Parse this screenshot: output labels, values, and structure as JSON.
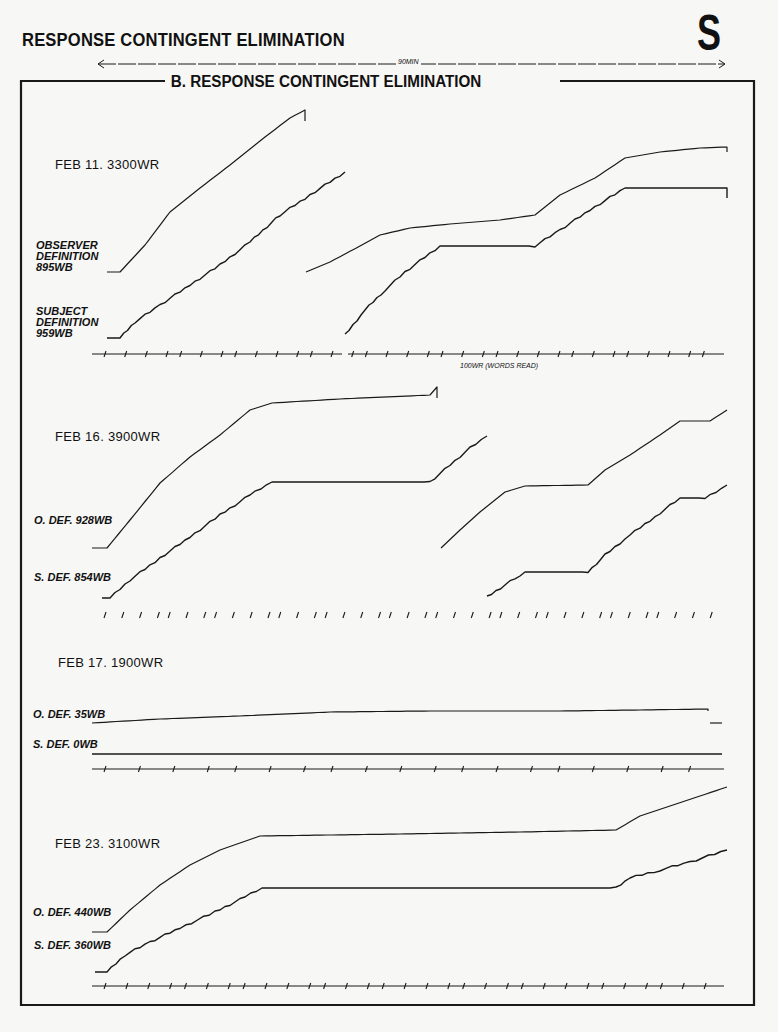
{
  "header": {
    "title": "RESPONSE CONTINGENT ELIMINATION",
    "corner_letter": "S",
    "duration_label": "90MIN",
    "frame_title": "B. RESPONSE CONTINGENT ELIMINATION"
  },
  "axis_note": "100WR (WORDS READ)",
  "panels": [
    {
      "date_label": "FEB 11. 3300WR",
      "observer_label": [
        "OBSERVER",
        "DEFINITION",
        "895WB"
      ],
      "subject_label": [
        "SUBJECT",
        "DEFINITION",
        "959WB"
      ]
    },
    {
      "date_label": "FEB 16. 3900WR",
      "observer_label": [
        "O. DEF. 928WB"
      ],
      "subject_label": [
        "S. DEF. 854WB"
      ]
    },
    {
      "date_label": "FEB 17. 1900WR",
      "observer_label": [
        "O. DEF. 35WB"
      ],
      "subject_label": [
        "S. DEF. 0WB"
      ]
    },
    {
      "date_label": "FEB 23. 3100WR",
      "observer_label": [
        "O. DEF. 440WB"
      ],
      "subject_label": [
        "S. DEF. 360WB"
      ]
    }
  ],
  "chart_data": {
    "type": "line",
    "title": "B. RESPONSE CONTINGENT ELIMINATION",
    "subtitle": "RESPONSE CONTINGENT ELIMINATION",
    "xlabel": "Time (session length 90 MIN); hash marks = 100WR (WORDS READ)",
    "ylabel": "Cumulative word-blocks (WB)",
    "legend": [
      "Observer definition (O. DEF.)",
      "Subject definition (S. DEF.)"
    ],
    "grid": false,
    "sessions": [
      {
        "date": "FEB 11",
        "words_read": 3300,
        "series": [
          {
            "name": "Observer definition",
            "total_wb": 895,
            "segments": [
              [
                [
                  107,
                  272
                ],
                [
                  120,
                  272
                ],
                [
                  145,
                  245
                ],
                [
                  170,
                  212
                ],
                [
                  200,
                  188
                ],
                [
                  230,
                  165
                ],
                [
                  265,
                  137
                ],
                [
                  290,
                  118
                ],
                [
                  305,
                  110
                ],
                [
                  305,
                  121
                ]
              ],
              [
                [
                  306,
                  272
                ],
                [
                  330,
                  262
                ],
                [
                  360,
                  246
                ],
                [
                  380,
                  235
                ],
                [
                  410,
                  228
                ],
                [
                  450,
                  224
                ],
                [
                  500,
                  220
                ],
                [
                  535,
                  215
                ],
                [
                  560,
                  195
                ],
                [
                  595,
                  178
                ],
                [
                  625,
                  158
                ],
                [
                  660,
                  152
                ],
                [
                  700,
                  148
                ],
                [
                  727,
                  147
                ],
                [
                  727,
                  152
                ]
              ]
            ]
          },
          {
            "name": "Subject definition",
            "total_wb": 959,
            "segments": [
              [
                [
                  107,
                  338
                ],
                [
                  120,
                  338
                ],
                [
                  135,
                  322
                ],
                [
                  160,
                  305
                ],
                [
                  190,
                  285
                ],
                [
                  220,
                  265
                ],
                [
                  250,
                  242
                ],
                [
                  280,
                  215
                ],
                [
                  310,
                  195
                ],
                [
                  345,
                  172
                ]
              ],
              [
                [
                  345,
                  335
                ],
                [
                  365,
                  310
                ],
                [
                  385,
                  290
                ],
                [
                  405,
                  272
                ],
                [
                  425,
                  257
                ],
                [
                  440,
                  246
                ],
                [
                  455,
                  246
                ],
                [
                  535,
                  246
                ],
                [
                  560,
                  230
                ],
                [
                  590,
                  210
                ],
                [
                  625,
                  188
                ],
                [
                  727,
                  188
                ],
                [
                  727,
                  198
                ]
              ]
            ]
          }
        ],
        "tick_axis_y": 354
      },
      {
        "date": "FEB 16",
        "words_read": 3900,
        "series": [
          {
            "name": "Observer definition",
            "total_wb": 928,
            "segments": [
              [
                [
                  92,
                  548
                ],
                [
                  107,
                  548
                ],
                [
                  130,
                  520
                ],
                [
                  160,
                  483
                ],
                [
                  190,
                  457
                ],
                [
                  220,
                  435
                ],
                [
                  250,
                  410
                ],
                [
                  272,
                  403
                ],
                [
                  340,
                  399
                ],
                [
                  430,
                  395
                ],
                [
                  437,
                  387
                ],
                [
                  437,
                  398
                ]
              ],
              [
                [
                  441,
                  548
                ],
                [
                  460,
                  530
                ],
                [
                  480,
                  512
                ],
                [
                  505,
                  492
                ],
                [
                  525,
                  486
                ],
                [
                  588,
                  485
                ],
                [
                  605,
                  470
                ],
                [
                  630,
                  455
                ],
                [
                  660,
                  435
                ],
                [
                  680,
                  421
                ],
                [
                  710,
                  421
                ],
                [
                  727,
                  410
                ]
              ]
            ]
          },
          {
            "name": "Subject definition",
            "total_wb": 854,
            "segments": [
              [
                [
                  102,
                  598
                ],
                [
                  110,
                  598
                ],
                [
                  130,
                  580
                ],
                [
                  160,
                  558
                ],
                [
                  190,
                  537
                ],
                [
                  220,
                  515
                ],
                [
                  250,
                  495
                ],
                [
                  272,
                  482
                ],
                [
                  430,
                  482
                ],
                [
                  450,
                  465
                ],
                [
                  470,
                  448
                ],
                [
                  487,
                  436
                ]
              ],
              [
                [
                  487,
                  597
                ],
                [
                  505,
                  585
                ],
                [
                  520,
                  575
                ],
                [
                  525,
                  572
                ],
                [
                  588,
                  572
                ],
                [
                  605,
                  555
                ],
                [
                  630,
                  535
                ],
                [
                  660,
                  513
                ],
                [
                  680,
                  498
                ],
                [
                  705,
                  498
                ],
                [
                  727,
                  485
                ]
              ]
            ]
          }
        ],
        "tick_axis_y": 615
      },
      {
        "date": "FEB 17",
        "words_read": 1900,
        "series": [
          {
            "name": "Observer definition",
            "total_wb": 35,
            "segments": [
              [
                [
                  92,
                  723
                ],
                [
                  160,
                  719
                ],
                [
                  240,
                  716
                ],
                [
                  330,
                  712
                ],
                [
                  430,
                  711
                ],
                [
                  560,
                  711
                ],
                [
                  640,
                  710
                ],
                [
                  708,
                  709
                ],
                [
                  708,
                  711
                ]
              ],
              [
                [
                  710,
                  723
                ],
                [
                  722,
                  723
                ]
              ]
            ]
          },
          {
            "name": "Subject definition",
            "total_wb": 0,
            "segments": [
              [
                [
                  92,
                  754
                ],
                [
                  722,
                  754
                ]
              ]
            ]
          }
        ],
        "tick_axis_y": 769
      },
      {
        "date": "FEB 23",
        "words_read": 3100,
        "series": [
          {
            "name": "Observer definition",
            "total_wb": 440,
            "segments": [
              [
                [
                  92,
                  932
                ],
                [
                  107,
                  932
                ],
                [
                  130,
                  910
                ],
                [
                  160,
                  885
                ],
                [
                  190,
                  865
                ],
                [
                  220,
                  850
                ],
                [
                  260,
                  836
                ],
                [
                  400,
                  834
                ],
                [
                  520,
                  832
                ],
                [
                  616,
                  830
                ],
                [
                  640,
                  816
                ],
                [
                  670,
                  806
                ],
                [
                  700,
                  796
                ],
                [
                  727,
                  787
                ]
              ]
            ]
          },
          {
            "name": "Subject definition",
            "total_wb": 360,
            "segments": [
              [
                [
                  95,
                  972
                ],
                [
                  107,
                  972
                ],
                [
                  125,
                  955
                ],
                [
                  150,
                  942
                ],
                [
                  180,
                  928
                ],
                [
                  215,
                  912
                ],
                [
                  245,
                  897
                ],
                [
                  262,
                  888
                ],
                [
                  400,
                  888
                ],
                [
                  520,
                  888
                ],
                [
                  616,
                  888
                ],
                [
                  630,
                  878
                ],
                [
                  660,
                  870
                ],
                [
                  690,
                  862
                ],
                [
                  727,
                  850
                ]
              ]
            ]
          }
        ],
        "tick_axis_y": 986
      }
    ],
    "duration_minutes": 90
  },
  "colors": {
    "ink": "#1a1a1a",
    "paper": "#f7f7f5"
  }
}
